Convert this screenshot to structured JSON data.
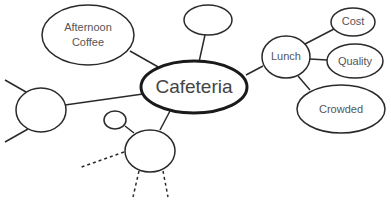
{
  "diagram": {
    "type": "mind-map",
    "central_node": {
      "label": "Cafeteria"
    },
    "nodes": {
      "afternoon_coffee": {
        "line1": "Afternoon",
        "line2": "Coffee"
      },
      "top_blank": {
        "label": ""
      },
      "lunch": {
        "label": "Lunch"
      },
      "cost": {
        "label": "Cost"
      },
      "quality": {
        "label": "Quality"
      },
      "crowded": {
        "label": "Crowded"
      },
      "left_blank": {
        "label": ""
      },
      "bottom_blank": {
        "label": ""
      },
      "small_blank": {
        "label": ""
      }
    },
    "edges": [
      [
        "Cafeteria",
        "Afternoon Coffee"
      ],
      [
        "Cafeteria",
        "top_blank"
      ],
      [
        "Cafeteria",
        "Lunch"
      ],
      [
        "Lunch",
        "Cost"
      ],
      [
        "Lunch",
        "Quality"
      ],
      [
        "Lunch",
        "Crowded"
      ],
      [
        "Cafeteria",
        "left_blank"
      ],
      [
        "Cafeteria",
        "bottom_blank"
      ],
      [
        "bottom_blank",
        "small_blank"
      ]
    ],
    "dashed_edges": 3,
    "colors": {
      "stroke": "#2a2a2a",
      "text": "#555555",
      "background": "#ffffff"
    }
  }
}
